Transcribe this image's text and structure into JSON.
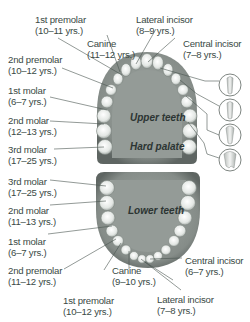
{
  "upper": {
    "title": "Upper teeth",
    "palate": "Hard palate",
    "labels": [
      {
        "name": "1st premolar",
        "age": "(10–11 yrs.)"
      },
      {
        "name": "Canine",
        "age": "(11–12 yrs.)"
      },
      {
        "name": "Lateral incisor",
        "age": "(8–9 yrs.)"
      },
      {
        "name": "Central incisor",
        "age": "(7–8 yrs.)"
      },
      {
        "name": "2nd premolar",
        "age": "(10–12 yrs.)"
      },
      {
        "name": "1st molar",
        "age": "(6–7 yrs.)"
      },
      {
        "name": "2nd molar",
        "age": "(12–13 yrs.)"
      },
      {
        "name": "3rd molar",
        "age": "(17–25 yrs.)"
      }
    ]
  },
  "lower": {
    "title": "Lower teeth",
    "labels": [
      {
        "name": "3rd molar",
        "age": "(17–25 yrs.)"
      },
      {
        "name": "2nd molar",
        "age": "(11–13 yrs.)"
      },
      {
        "name": "1st molar",
        "age": "(6–7 yrs.)"
      },
      {
        "name": "2nd premolar",
        "age": "(11–12 yrs.)"
      },
      {
        "name": "Canine",
        "age": "(9–10 yrs.)"
      },
      {
        "name": "Central incisor",
        "age": "(6–7 yrs.)"
      },
      {
        "name": "1st premolar",
        "age": "(10–12 yrs.)"
      },
      {
        "name": "Lateral incisor",
        "age": "(7–8 yrs.)"
      }
    ]
  },
  "colors": {
    "text": "#3a4a45",
    "gum": "#8e9591",
    "gum_dark": "#5f6663",
    "tooth": "#e9ece9",
    "line": "#4a5550"
  }
}
